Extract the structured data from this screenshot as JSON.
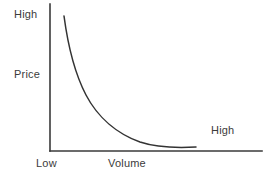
{
  "chart_data": {
    "type": "line",
    "title": "",
    "subtitle": "",
    "xlabel": "Volume",
    "ylabel": "Price",
    "grid": false,
    "legend": null,
    "axis_style": "two-axis-lines-no-ticks",
    "x_tick_labels": [
      "Low",
      "High"
    ],
    "y_tick_labels": [
      "High"
    ],
    "xlim": [
      0,
      1
    ],
    "ylim": [
      0,
      1
    ],
    "annotations": [
      {
        "text": "High",
        "axis": "y",
        "position": "top-left",
        "meaning": "high price"
      },
      {
        "text": "Price",
        "axis": "y",
        "position": "middle-left",
        "meaning": "y-axis title"
      },
      {
        "text": "Low",
        "axis": "x",
        "position": "bottom-left",
        "meaning": "low volume"
      },
      {
        "text": "Volume",
        "axis": "x",
        "position": "bottom-center",
        "meaning": "x-axis title"
      },
      {
        "text": "High",
        "axis": "x",
        "position": "right",
        "meaning": "high volume"
      }
    ],
    "series": [
      {
        "name": "Price vs Volume",
        "shape": "decreasing convex hyperbolic curve",
        "color": "#333333",
        "x": [
          0.1,
          0.13,
          0.17,
          0.21,
          0.26,
          0.31,
          0.37,
          0.44,
          0.52,
          0.6,
          0.68,
          0.76,
          0.83,
          0.89,
          0.94,
          0.97,
          1.0
        ],
        "y": [
          0.92,
          0.8,
          0.68,
          0.58,
          0.49,
          0.41,
          0.34,
          0.27,
          0.21,
          0.16,
          0.12,
          0.09,
          0.06,
          0.045,
          0.035,
          0.03,
          0.03
        ]
      }
    ],
    "curve_path": "M 64 16 C 68 46, 74 72, 86 95 C 98 118, 118 134, 140 142 C 158 148, 178 148, 196 147",
    "axes": {
      "y_axis_line": {
        "x": 50,
        "y_top": 4,
        "y_bottom": 151
      },
      "x_axis_line": {
        "y": 151,
        "x_left": 50,
        "x_right": 262
      },
      "line_color": "#3a3a3a",
      "line_width": 1.4
    }
  },
  "labels": {
    "y_high": "High",
    "y_title": "Price",
    "x_low": "Low",
    "x_title": "Volume",
    "x_high": "High"
  },
  "colors": {
    "background": "#ffffff",
    "axis": "#3a3a3a",
    "curve": "#333333",
    "text": "#3b3b3b"
  }
}
